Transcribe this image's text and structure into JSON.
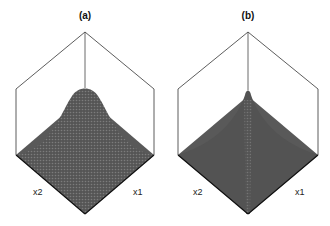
{
  "panels": [
    {
      "title": "(a)",
      "axis_left": "x2",
      "axis_right": "x1",
      "surface": "smooth gaussian peak"
    },
    {
      "title": "(b)",
      "axis_left": "x2",
      "axis_right": "x1",
      "surface": "sharp narrow peak"
    }
  ],
  "colors": {
    "surface": "#5a5a5a",
    "mesh": "#7a7a7a",
    "frame": "#333333",
    "background": "#ffffff"
  }
}
